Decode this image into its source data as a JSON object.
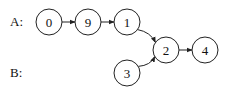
{
  "lists": [
    {
      "label": "A:",
      "nodes": [
        "0",
        "9",
        "1"
      ]
    },
    {
      "label": "B:",
      "nodes": [
        "3"
      ]
    }
  ],
  "shared": [
    "2",
    "4"
  ],
  "nodes": {
    "n0": "0",
    "n9": "9",
    "n1": "1",
    "n2": "2",
    "n4": "4",
    "n3": "3"
  },
  "edges": [
    {
      "from": "n0",
      "to": "n9"
    },
    {
      "from": "n9",
      "to": "n1"
    },
    {
      "from": "n1",
      "to": "n2"
    },
    {
      "from": "n3",
      "to": "n2"
    },
    {
      "from": "n2",
      "to": "n4"
    }
  ]
}
